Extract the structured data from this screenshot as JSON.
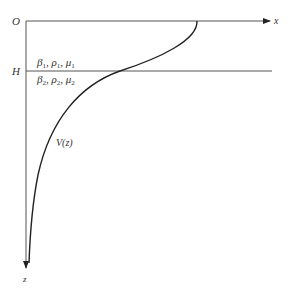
{
  "diagram": {
    "origin_label": "O",
    "x_axis_label": "x",
    "z_axis_label": "z",
    "interface_label": "H",
    "curve_label": "V(z)",
    "layer1": {
      "params": [
        {
          "symbol": "β",
          "sub": "1"
        },
        {
          "symbol": "ρ",
          "sub": "1"
        },
        {
          "symbol": "μ",
          "sub": "1"
        }
      ]
    },
    "layer2": {
      "params": [
        {
          "symbol": "β",
          "sub": "2"
        },
        {
          "symbol": "ρ",
          "sub": "2"
        },
        {
          "symbol": "μ",
          "sub": "2"
        }
      ]
    },
    "separator": ", ",
    "colors": {
      "line": "#444444",
      "curve": "#222222",
      "text": "#333333"
    }
  }
}
